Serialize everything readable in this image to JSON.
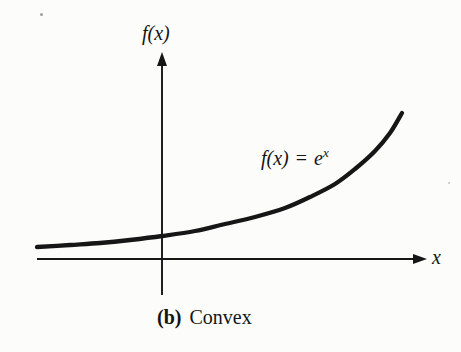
{
  "figure": {
    "background": "#fcfcfa",
    "ink_color": "#161616"
  },
  "labels": {
    "y_axis": "f(x)",
    "x_axis": "x",
    "curve_lhs": "f(x)",
    "curve_eq": "=",
    "curve_base": "e",
    "curve_exp": "x"
  },
  "caption": {
    "index": "(b)",
    "text": "Convex"
  },
  "chart_data": {
    "type": "line",
    "title": "",
    "function": "f(x) = e^x",
    "xlabel": "x",
    "ylabel": "f(x)",
    "grid": false,
    "legend": "none",
    "axis_ticks": "none",
    "annotation": "(b) Convex",
    "axes_px": {
      "origin": [
        162,
        259
      ],
      "x_axis": {
        "y": 259,
        "x_left": 37,
        "x_right": 416,
        "arrow_tip_x": 427
      },
      "y_axis": {
        "x": 162,
        "y_bottom": 295,
        "y_top": 62,
        "arrow_tip_y": 52
      }
    },
    "curve_points_px": [
      [
        37,
        247
      ],
      [
        70,
        245
      ],
      [
        100,
        243
      ],
      [
        130,
        240
      ],
      [
        162,
        236
      ],
      [
        195,
        231
      ],
      [
        225,
        224
      ],
      [
        255,
        217
      ],
      [
        285,
        208
      ],
      [
        310,
        197
      ],
      [
        335,
        184
      ],
      [
        355,
        169
      ],
      [
        375,
        151
      ],
      [
        390,
        133
      ],
      [
        402,
        113
      ]
    ],
    "curve_stroke_width": 4.3,
    "axis_stroke_width": 1.9
  }
}
